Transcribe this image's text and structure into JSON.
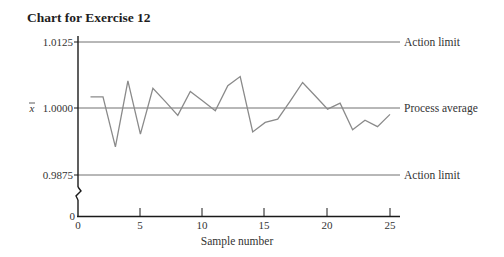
{
  "title": "Chart for Exercise 12",
  "chart_data": {
    "type": "line",
    "title": "Chart for Exercise 12",
    "xlabel": "Sample number",
    "ylabel": "x̄",
    "x": [
      1,
      2,
      3,
      4,
      5,
      6,
      7,
      8,
      9,
      10,
      11,
      12,
      13,
      14,
      15,
      16,
      17,
      18,
      19,
      20,
      21,
      22,
      23,
      24,
      25
    ],
    "series": [
      {
        "name": "Sample mean",
        "values": [
          1.0021,
          1.0021,
          0.9927,
          1.0051,
          0.9951,
          1.0037,
          1.0012,
          0.9986,
          1.0031,
          1.0013,
          0.9995,
          1.0042,
          1.0059,
          0.9955,
          0.9973,
          0.9979,
          1.0013,
          1.0048,
          1.0023,
          0.9998,
          1.0009,
          0.9959,
          0.9977,
          0.9965,
          0.9988
        ]
      }
    ],
    "reference_lines": [
      {
        "value": 1.0125,
        "label": "Action limit"
      },
      {
        "value": 1.0,
        "label": "Process average"
      },
      {
        "value": 0.9875,
        "label": "Action limit"
      }
    ],
    "y_tick_labels": [
      "1.0125",
      "1.0000",
      "0.9875",
      "0"
    ],
    "x_tick_labels": [
      "0",
      "5",
      "10",
      "15",
      "20",
      "25"
    ],
    "xlim": [
      0,
      25
    ],
    "ylim": [
      0.9875,
      1.0125
    ],
    "y_axis_break": true,
    "grid": false,
    "legend": "none (labels at right end of reference lines)"
  },
  "axes": {
    "xlabel": "Sample number",
    "ylabel": "x̄",
    "y_ticks": [
      "1.0125",
      "1.0000",
      "0.9875",
      "0"
    ],
    "x_ticks": [
      "0",
      "5",
      "10",
      "15",
      "20",
      "25"
    ]
  },
  "ref_labels": {
    "upper": "Action limit",
    "middle": "Process average",
    "lower": "Action limit"
  },
  "colors": {
    "axis": "#1a1a1a",
    "reference_line": "#707070",
    "data_line": "#8a8a8a"
  }
}
